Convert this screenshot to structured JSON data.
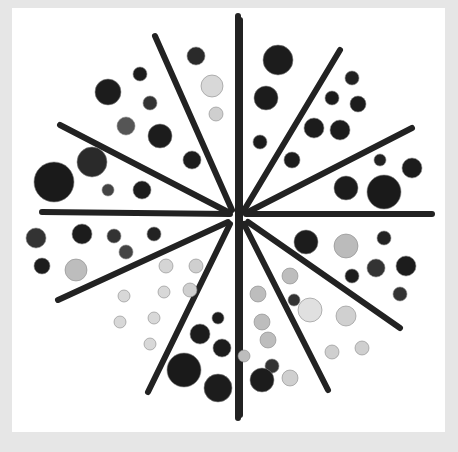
{
  "image": {
    "description": "Photograph of black, gray and white buttons arranged between dark sticks radiating from a center point, on a white square over light gray background",
    "colors": {
      "background": "#e6e6e6",
      "card": "#ffffff",
      "stick": "#222222",
      "button_dark": "#1c1c1c",
      "button_light": "#d8d8d8"
    },
    "center": [
      236,
      215
    ],
    "sticks": [
      [
        238,
        16,
        238,
        418
      ],
      [
        155,
        36,
        232,
        210
      ],
      [
        340,
        50,
        243,
        212
      ],
      [
        60,
        125,
        228,
        212
      ],
      [
        412,
        128,
        248,
        212
      ],
      [
        42,
        212,
        230,
        214
      ],
      [
        432,
        214,
        246,
        214
      ],
      [
        58,
        300,
        228,
        222
      ],
      [
        400,
        328,
        248,
        222
      ],
      [
        148,
        392,
        230,
        224
      ],
      [
        328,
        390,
        244,
        224
      ],
      [
        240,
        20,
        240,
        415
      ]
    ],
    "buttons": [
      {
        "x": 108,
        "y": 92,
        "r": 13,
        "c": "#1c1c1c"
      },
      {
        "x": 140,
        "y": 74,
        "r": 7,
        "c": "#1c1c1c"
      },
      {
        "x": 196,
        "y": 56,
        "r": 9,
        "c": "#2a2a2a"
      },
      {
        "x": 212,
        "y": 86,
        "r": 11,
        "c": "#d8d8d8"
      },
      {
        "x": 150,
        "y": 103,
        "r": 7,
        "c": "#333"
      },
      {
        "x": 216,
        "y": 114,
        "r": 7,
        "c": "#cfcfcf"
      },
      {
        "x": 126,
        "y": 126,
        "r": 9,
        "c": "#555"
      },
      {
        "x": 160,
        "y": 136,
        "r": 12,
        "c": "#1c1c1c"
      },
      {
        "x": 92,
        "y": 162,
        "r": 15,
        "c": "#2a2a2a"
      },
      {
        "x": 54,
        "y": 182,
        "r": 20,
        "c": "#1a1a1a"
      },
      {
        "x": 108,
        "y": 190,
        "r": 6,
        "c": "#444"
      },
      {
        "x": 142,
        "y": 190,
        "r": 9,
        "c": "#1c1c1c"
      },
      {
        "x": 192,
        "y": 160,
        "r": 9,
        "c": "#1c1c1c"
      },
      {
        "x": 278,
        "y": 60,
        "r": 15,
        "c": "#1c1c1c"
      },
      {
        "x": 266,
        "y": 98,
        "r": 12,
        "c": "#1c1c1c"
      },
      {
        "x": 352,
        "y": 78,
        "r": 7,
        "c": "#222"
      },
      {
        "x": 332,
        "y": 98,
        "r": 7,
        "c": "#1c1c1c"
      },
      {
        "x": 358,
        "y": 104,
        "r": 8,
        "c": "#1c1c1c"
      },
      {
        "x": 314,
        "y": 128,
        "r": 10,
        "c": "#1c1c1c"
      },
      {
        "x": 340,
        "y": 130,
        "r": 10,
        "c": "#1c1c1c"
      },
      {
        "x": 260,
        "y": 142,
        "r": 7,
        "c": "#1c1c1c"
      },
      {
        "x": 292,
        "y": 160,
        "r": 8,
        "c": "#1c1c1c"
      },
      {
        "x": 380,
        "y": 160,
        "r": 6,
        "c": "#222"
      },
      {
        "x": 412,
        "y": 168,
        "r": 10,
        "c": "#1c1c1c"
      },
      {
        "x": 346,
        "y": 188,
        "r": 12,
        "c": "#1c1c1c"
      },
      {
        "x": 384,
        "y": 192,
        "r": 17,
        "c": "#1a1a1a"
      },
      {
        "x": 36,
        "y": 238,
        "r": 10,
        "c": "#333"
      },
      {
        "x": 82,
        "y": 234,
        "r": 10,
        "c": "#1c1c1c"
      },
      {
        "x": 114,
        "y": 236,
        "r": 7,
        "c": "#333"
      },
      {
        "x": 154,
        "y": 234,
        "r": 7,
        "c": "#222"
      },
      {
        "x": 126,
        "y": 252,
        "r": 7,
        "c": "#444"
      },
      {
        "x": 42,
        "y": 266,
        "r": 8,
        "c": "#1c1c1c"
      },
      {
        "x": 76,
        "y": 270,
        "r": 11,
        "c": "#bdbdbd"
      },
      {
        "x": 166,
        "y": 266,
        "r": 7,
        "c": "#d5d5d5"
      },
      {
        "x": 196,
        "y": 266,
        "r": 7,
        "c": "#cfcfcf"
      },
      {
        "x": 306,
        "y": 242,
        "r": 12,
        "c": "#1c1c1c"
      },
      {
        "x": 346,
        "y": 246,
        "r": 12,
        "c": "#bbbbbb"
      },
      {
        "x": 384,
        "y": 238,
        "r": 7,
        "c": "#222"
      },
      {
        "x": 406,
        "y": 266,
        "r": 10,
        "c": "#1c1c1c"
      },
      {
        "x": 376,
        "y": 268,
        "r": 9,
        "c": "#333"
      },
      {
        "x": 352,
        "y": 276,
        "r": 7,
        "c": "#1c1c1c"
      },
      {
        "x": 290,
        "y": 276,
        "r": 8,
        "c": "#bdbdbd"
      },
      {
        "x": 400,
        "y": 294,
        "r": 7,
        "c": "#333"
      },
      {
        "x": 124,
        "y": 296,
        "r": 6,
        "c": "#d8d8d8"
      },
      {
        "x": 164,
        "y": 292,
        "r": 6,
        "c": "#d8d8d8"
      },
      {
        "x": 190,
        "y": 290,
        "r": 7,
        "c": "#cfcfcf"
      },
      {
        "x": 258,
        "y": 294,
        "r": 8,
        "c": "#bdbdbd"
      },
      {
        "x": 294,
        "y": 300,
        "r": 6,
        "c": "#333"
      },
      {
        "x": 310,
        "y": 310,
        "r": 12,
        "c": "#e0e0e0"
      },
      {
        "x": 346,
        "y": 316,
        "r": 10,
        "c": "#d0d0d0"
      },
      {
        "x": 120,
        "y": 322,
        "r": 6,
        "c": "#d8d8d8"
      },
      {
        "x": 154,
        "y": 318,
        "r": 6,
        "c": "#d8d8d8"
      },
      {
        "x": 218,
        "y": 318,
        "r": 6,
        "c": "#1c1c1c"
      },
      {
        "x": 262,
        "y": 322,
        "r": 8,
        "c": "#bdbdbd"
      },
      {
        "x": 200,
        "y": 334,
        "r": 10,
        "c": "#1c1c1c"
      },
      {
        "x": 268,
        "y": 340,
        "r": 8,
        "c": "#bdbdbd"
      },
      {
        "x": 150,
        "y": 344,
        "r": 6,
        "c": "#d8d8d8"
      },
      {
        "x": 222,
        "y": 348,
        "r": 9,
        "c": "#1c1c1c"
      },
      {
        "x": 332,
        "y": 352,
        "r": 7,
        "c": "#cfcfcf"
      },
      {
        "x": 362,
        "y": 348,
        "r": 7,
        "c": "#cfcfcf"
      },
      {
        "x": 184,
        "y": 370,
        "r": 17,
        "c": "#1a1a1a"
      },
      {
        "x": 244,
        "y": 356,
        "r": 6,
        "c": "#bdbdbd"
      },
      {
        "x": 272,
        "y": 366,
        "r": 7,
        "c": "#333"
      },
      {
        "x": 218,
        "y": 388,
        "r": 14,
        "c": "#1c1c1c"
      },
      {
        "x": 262,
        "y": 380,
        "r": 12,
        "c": "#1c1c1c"
      },
      {
        "x": 290,
        "y": 378,
        "r": 8,
        "c": "#cfcfcf"
      }
    ]
  }
}
